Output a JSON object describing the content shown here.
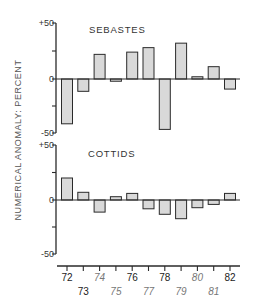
{
  "chart_data": [
    {
      "type": "bar",
      "title": "SEBASTES",
      "xlabel": "",
      "ylabel": "NUMERICAL ANOMALY: PERCENT",
      "ylim": [
        -50,
        50
      ],
      "yticks": [
        "+50",
        "0",
        "-50"
      ],
      "categories": [
        "72",
        "73",
        "74",
        "75",
        "76",
        "77",
        "78",
        "79",
        "80",
        "81",
        "82"
      ],
      "values": [
        -40,
        -11,
        22,
        -2,
        24,
        28,
        -45,
        32,
        2,
        11,
        -9
      ]
    },
    {
      "type": "bar",
      "title": "COTTIDS",
      "xlabel": "",
      "ylabel": "NUMERICAL ANOMALY: PERCENT",
      "ylim": [
        -50,
        50
      ],
      "yticks": [
        "+50",
        "0",
        "-50"
      ],
      "categories": [
        "72",
        "73",
        "74",
        "75",
        "76",
        "77",
        "78",
        "79",
        "80",
        "81",
        "82"
      ],
      "values": [
        20,
        7,
        -11,
        3,
        6,
        -8,
        -13,
        -17,
        -7,
        -4,
        6
      ]
    }
  ],
  "ylabel": "NUMERICAL ANOMALY: PERCENT",
  "panels": [
    {
      "title": "SEBASTES",
      "ticks": {
        "top": "+50",
        "zero": "0",
        "bottom": "-50"
      }
    },
    {
      "title": "COTTIDS",
      "ticks": {
        "top": "+50",
        "zero": "0",
        "bottom": "-50"
      }
    }
  ],
  "x_labels": [
    "72",
    "73",
    "74",
    "75",
    "76",
    "77",
    "78",
    "79",
    "80",
    "81",
    "82"
  ],
  "colors": {
    "bar_fill": "#d9d9d9",
    "stroke": "#2a2a2a"
  }
}
